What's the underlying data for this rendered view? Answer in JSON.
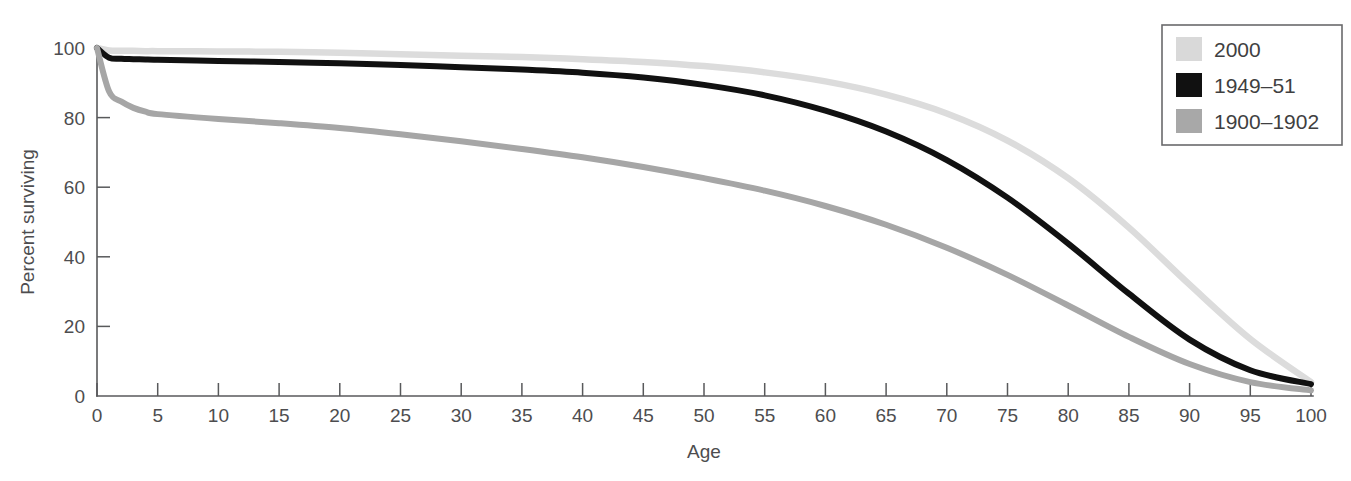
{
  "chart_data": {
    "type": "line",
    "title": "",
    "xlabel": "Age",
    "ylabel": "Percent surviving",
    "xlim": [
      0,
      100
    ],
    "ylim": [
      0,
      100
    ],
    "grid": false,
    "legend_position": "top-right",
    "xticks": [
      0,
      5,
      10,
      15,
      20,
      25,
      30,
      35,
      40,
      45,
      50,
      55,
      60,
      65,
      70,
      75,
      80,
      85,
      90,
      95,
      100
    ],
    "yticks": [
      0,
      20,
      40,
      60,
      80,
      100
    ],
    "x": [
      0,
      1,
      2,
      3,
      4,
      5,
      10,
      15,
      20,
      25,
      30,
      35,
      40,
      45,
      50,
      55,
      60,
      65,
      70,
      75,
      80,
      85,
      90,
      95,
      100
    ],
    "series": [
      {
        "name": "2000",
        "color": "#dcdcdc",
        "width": 6.5,
        "values": [
          100,
          99.3,
          99.2,
          99.2,
          99.1,
          99.1,
          99.0,
          98.9,
          98.6,
          98.2,
          97.8,
          97.4,
          96.8,
          96.0,
          94.8,
          93.0,
          90.4,
          86.6,
          81.2,
          73.4,
          62.6,
          48.4,
          32.0,
          16.4,
          4.0
        ]
      },
      {
        "name": "1949–51",
        "color": "#111111",
        "width": 6.0,
        "values": [
          100,
          97.2,
          96.9,
          96.8,
          96.7,
          96.6,
          96.3,
          96.0,
          95.6,
          95.1,
          94.5,
          93.8,
          92.9,
          91.5,
          89.4,
          86.4,
          82.0,
          76.0,
          67.8,
          57.0,
          43.8,
          29.4,
          16.2,
          7.4,
          3.4
        ]
      },
      {
        "name": "1900–1902",
        "color": "#a6a6a6",
        "width": 6.0,
        "values": [
          100,
          87.5,
          84.6,
          82.8,
          81.7,
          81.0,
          79.6,
          78.4,
          77.0,
          75.2,
          73.2,
          71.0,
          68.6,
          65.8,
          62.6,
          59.0,
          54.6,
          49.2,
          42.6,
          34.8,
          26.0,
          17.0,
          9.2,
          4.0,
          1.6
        ]
      }
    ]
  },
  "legend": {
    "items": [
      {
        "label": "2000",
        "swatch": "#d9d9d9"
      },
      {
        "label": "1949–51",
        "swatch": "#111111"
      },
      {
        "label": "1900–1902",
        "swatch": "#a8a8a8"
      }
    ]
  }
}
